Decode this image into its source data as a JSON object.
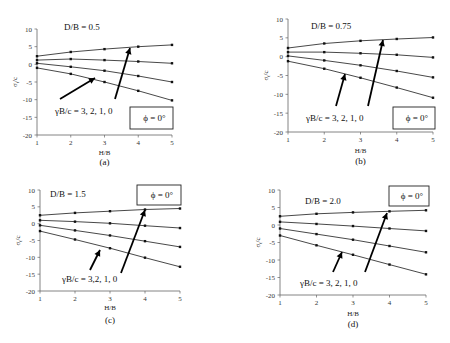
{
  "chart_data": [
    {
      "type": "line",
      "panel": "(a)",
      "title": "D/B = 0.5",
      "annotation_phi": "ϕ = 0°",
      "annotation_series": "γB/c = 3, 2, 1, 0",
      "xlabel": "H/B",
      "ylabel": "σt/c",
      "x": [
        1,
        2,
        3,
        4,
        5
      ],
      "xlim": [
        1,
        5
      ],
      "ylim": [
        -20,
        10
      ],
      "xticks": [
        1,
        2,
        3,
        4,
        5
      ],
      "yticks": [
        10,
        5,
        0,
        -5,
        -10,
        -15,
        -20
      ],
      "grid": false,
      "series": [
        {
          "name": "γB/c = 0",
          "values": [
            2.3,
            3.5,
            4.3,
            5.0,
            5.5
          ]
        },
        {
          "name": "γB/c = 1",
          "values": [
            1.2,
            1.5,
            1.2,
            0.8,
            0.3
          ]
        },
        {
          "name": "γB/c = 2",
          "values": [
            0.3,
            -0.7,
            -1.8,
            -3.3,
            -5.0
          ]
        },
        {
          "name": "γB/c = 3",
          "values": [
            -1.0,
            -2.7,
            -5.0,
            -7.5,
            -10.2
          ]
        }
      ]
    },
    {
      "type": "line",
      "panel": "(b)",
      "title": "D/B = 0.75",
      "annotation_phi": "ϕ = 0°",
      "annotation_series": "γB/c = 3, 2, 1, 0",
      "xlabel": "H/B",
      "ylabel": "σt/c",
      "x": [
        1,
        2,
        3,
        4,
        5
      ],
      "xlim": [
        1,
        5
      ],
      "ylim": [
        -20,
        10
      ],
      "xticks": [
        1,
        2,
        3,
        4,
        5
      ],
      "yticks": [
        10,
        5,
        0,
        -5,
        -10,
        -15,
        -20
      ],
      "grid": false,
      "series": [
        {
          "name": "γB/c = 0",
          "values": [
            2.3,
            3.5,
            4.2,
            4.7,
            5.1
          ]
        },
        {
          "name": "γB/c = 1",
          "values": [
            1.2,
            1.2,
            0.9,
            0.5,
            -0.2
          ]
        },
        {
          "name": "γB/c = 2",
          "values": [
            0.2,
            -1.0,
            -2.3,
            -3.8,
            -5.5
          ]
        },
        {
          "name": "γB/c = 3",
          "values": [
            -1.2,
            -3.2,
            -5.6,
            -8.2,
            -10.9
          ]
        }
      ]
    },
    {
      "type": "line",
      "panel": "(c)",
      "title": "D/B = 1.5",
      "annotation_phi": "ϕ = 0°",
      "annotation_series": "γB/c = 3,2, 1, 0",
      "xlabel": "H/B",
      "ylabel": "σt/c",
      "x": [
        1,
        2,
        3,
        4,
        5
      ],
      "xlim": [
        1,
        5
      ],
      "ylim": [
        -20,
        10
      ],
      "xticks": [
        1,
        2,
        3,
        4,
        5
      ],
      "yticks": [
        10,
        5,
        0,
        -5,
        -10,
        -15,
        -20
      ],
      "grid": false,
      "series": [
        {
          "name": "γB/c = 0",
          "values": [
            2.5,
            3.2,
            3.7,
            4.2,
            4.5
          ]
        },
        {
          "name": "γB/c = 1",
          "values": [
            1.0,
            0.6,
            0.1,
            -0.6,
            -1.3
          ]
        },
        {
          "name": "γB/c = 2",
          "values": [
            -0.5,
            -2.0,
            -3.5,
            -5.2,
            -6.9
          ]
        },
        {
          "name": "γB/c = 3",
          "values": [
            -2.2,
            -4.7,
            -7.3,
            -10.1,
            -12.8
          ]
        }
      ]
    },
    {
      "type": "line",
      "panel": "(d)",
      "title": "D/B = 2.0",
      "annotation_phi": "ϕ = 0°",
      "annotation_series": "γB/c = 3, 2, 1, 0",
      "xlabel": "H/B",
      "ylabel": "σt/c",
      "x": [
        1,
        2,
        3,
        4,
        5
      ],
      "xlim": [
        1,
        5
      ],
      "ylim": [
        -20,
        10
      ],
      "xticks": [
        1,
        2,
        3,
        4,
        5
      ],
      "yticks": [
        10,
        5,
        0,
        -5,
        -10,
        -15,
        -20
      ],
      "grid": false,
      "series": [
        {
          "name": "γB/c = 0",
          "values": [
            2.5,
            3.2,
            3.6,
            3.9,
            4.2
          ]
        },
        {
          "name": "γB/c = 1",
          "values": [
            0.9,
            0.3,
            -0.3,
            -1.0,
            -1.7
          ]
        },
        {
          "name": "γB/c = 2",
          "values": [
            -1.0,
            -2.6,
            -4.2,
            -6.0,
            -7.8
          ]
        },
        {
          "name": "γB/c = 3",
          "values": [
            -3.0,
            -5.8,
            -8.5,
            -11.3,
            -14.1
          ]
        }
      ]
    }
  ],
  "layout": {
    "panels": [
      {
        "left": 0,
        "top": 0,
        "plot": {
          "x0": 37,
          "x1": 172,
          "y_top": 29,
          "y_bot": 135
        },
        "title_pos": [
          64,
          30
        ],
        "phi_box": [
          130,
          107,
          43,
          22
        ],
        "phi_box_side": "bottom-right",
        "gamma_pos": [
          55,
          114
        ],
        "arrow1": [
          [
            60,
            99
          ],
          [
            95,
            78
          ]
        ],
        "arrow2": [
          [
            115,
            99
          ],
          [
            130,
            48
          ]
        ],
        "caption_y": 165,
        "xlabel_y": 155
      },
      {
        "left": 225,
        "top": 0,
        "plot": {
          "x0": 63,
          "x1": 208,
          "y_top": 19,
          "y_bot": 132
        },
        "title_pos": [
          86,
          29
        ],
        "phi_box": [
          168,
          107,
          42,
          22
        ],
        "phi_box_side": "bottom-right",
        "gamma_pos": [
          81,
          121
        ],
        "arrow1": [
          [
            111,
            106
          ],
          [
            120,
            74
          ]
        ],
        "arrow2": [
          [
            143,
            106
          ],
          [
            158,
            40
          ]
        ],
        "caption_y": 164,
        "xlabel_y": 153
      },
      {
        "left": 0,
        "top": 170,
        "plot": {
          "x0": 40,
          "x1": 180,
          "y_top": 20,
          "y_bot": 121
        },
        "title_pos": [
          50,
          27
        ],
        "phi_box": [
          137,
          15,
          44,
          20
        ],
        "phi_box_side": "top-right",
        "gamma_pos": [
          62,
          112
        ],
        "arrow1": [
          [
            90,
            100
          ],
          [
            100,
            80
          ]
        ],
        "arrow2": [
          [
            121,
            103
          ],
          [
            145,
            40
          ]
        ],
        "caption_y": 153,
        "xlabel_y": 140
      },
      {
        "left": 225,
        "top": 170,
        "plot": {
          "x0": 55,
          "x1": 201,
          "y_top": 20,
          "y_bot": 125
        },
        "title_pos": [
          80,
          34
        ],
        "phi_box": [
          164,
          16,
          40,
          20
        ],
        "phi_box_side": "top-right",
        "gamma_pos": [
          75,
          116
        ],
        "arrow1": [
          [
            108,
            102
          ],
          [
            117,
            82
          ]
        ],
        "arrow2": [
          [
            140,
            102
          ],
          [
            162,
            43
          ]
        ],
        "caption_y": 157,
        "xlabel_y": 146
      }
    ]
  },
  "colors": {
    "line": "#333333",
    "marker": "#111111",
    "axis": "#666666",
    "text": "#111111"
  }
}
